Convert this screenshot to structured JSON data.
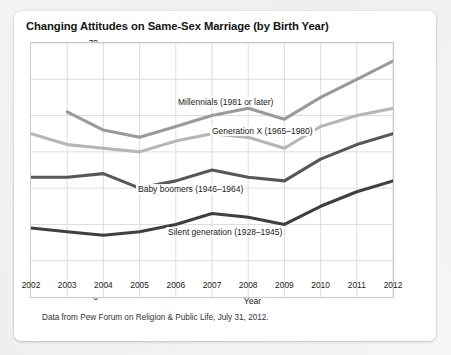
{
  "figure": {
    "title": "Changing Attitudes on Same-Sex Marriage (by Birth Year)",
    "source_note": "Data from Pew Forum on Religion & Public Life, July 31, 2012."
  },
  "chart_data": {
    "type": "line",
    "title": "Changing Attitudes on Same-Sex Marriage (by Birth Year)",
    "xlabel": "Year",
    "ylabel": "Percent who favor same-sex marriage",
    "ylabel_lines": [
      "Percent",
      "who favor",
      "same-sex",
      "marriage"
    ],
    "x": [
      2002,
      2003,
      2004,
      2005,
      2006,
      2007,
      2008,
      2009,
      2010,
      2011,
      2012
    ],
    "xtick_labels": [
      "2002",
      "2003",
      "2004",
      "2005",
      "2006",
      "2007",
      "2008",
      "2009",
      "2010",
      "2011",
      "2012"
    ],
    "ytick_labels": [
      "0",
      "10",
      "20",
      "30",
      "40",
      "50",
      "60",
      "70"
    ],
    "ylim": [
      0,
      70
    ],
    "xlim": [
      2002,
      2012
    ],
    "ytick_step": 10,
    "grid": true,
    "legend": "inline-annotations",
    "series": [
      {
        "name": "Millennials (1981 or later)",
        "label": "Millennials (1981 or later)",
        "color": "#9a9a9a",
        "x": [
          2003,
          2004,
          2005,
          2006,
          2007,
          2008,
          2009,
          2010,
          2011,
          2012
        ],
        "values": [
          51,
          46,
          44,
          47,
          50,
          52,
          49,
          55,
          60,
          65
        ]
      },
      {
        "name": "Generation X (1965-1980)",
        "label": "Generation X (1965–1980)",
        "color": "#b6b6b6",
        "x": [
          2002,
          2003,
          2004,
          2005,
          2006,
          2007,
          2008,
          2009,
          2010,
          2011,
          2012
        ],
        "values": [
          45,
          42,
          41,
          40,
          43,
          45,
          44,
          41,
          47,
          50,
          52
        ]
      },
      {
        "name": "Baby boomers (1946-1964)",
        "label": "Baby boomers (1946–1964)",
        "color": "#575757",
        "x": [
          2002,
          2003,
          2004,
          2005,
          2006,
          2007,
          2008,
          2009,
          2010,
          2011,
          2012
        ],
        "values": [
          33,
          33,
          34,
          30,
          32,
          35,
          33,
          32,
          38,
          42,
          45
        ]
      },
      {
        "name": "Silent generation (1928-1945)",
        "label": "Silent generation (1928–1945)",
        "color": "#3f3f3f",
        "x": [
          2002,
          2003,
          2004,
          2005,
          2006,
          2007,
          2008,
          2009,
          2010,
          2011,
          2012
        ],
        "values": [
          19,
          18,
          17,
          18,
          20,
          23,
          22,
          20,
          25,
          29,
          32
        ]
      }
    ],
    "annotations": [
      {
        "text": "Millennials (1981 or later)",
        "x_px": 176,
        "y_px": 97
      },
      {
        "text": "Generation X (1965–1980)",
        "x_px": 210,
        "y_px": 126
      },
      {
        "text": "Baby boomers (1946–1964)",
        "x_px": 136,
        "y_px": 184
      },
      {
        "text": "Silent generation (1928–1945)",
        "x_px": 166,
        "y_px": 227
      }
    ]
  }
}
